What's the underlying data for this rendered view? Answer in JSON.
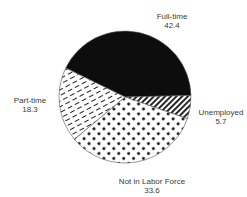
{
  "chart_data": {
    "type": "pie",
    "title": "",
    "slices": [
      {
        "label": "Full-time",
        "value": 42.4,
        "pattern": "solid-black"
      },
      {
        "label": "Unemployed",
        "value": 5.7,
        "pattern": "diagonal-stripes"
      },
      {
        "label": "Not in Labor Force",
        "value": 33.6,
        "pattern": "dots"
      },
      {
        "label": "Part-time",
        "value": 18.3,
        "pattern": "dashes"
      }
    ],
    "legend": "none",
    "labels_position": "outside"
  },
  "labels": {
    "fulltime_name": "Full-time",
    "fulltime_value": "42.4",
    "unemployed_name": "Unemployed",
    "unemployed_value": "5.7",
    "nilf_name": "Not in Labor Force",
    "nilf_value": "33.6",
    "parttime_name": "Part-time",
    "parttime_value": "18.3"
  }
}
